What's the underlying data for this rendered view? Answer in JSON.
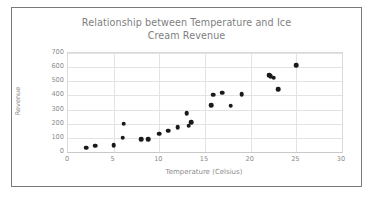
{
  "chart_data": {
    "type": "scatter",
    "title": "Relationship between Temperature and Ice Cream Revenue",
    "title_line1": "Relationship between Temperature and Ice",
    "title_line2": "Cream Revenue",
    "xlabel": "Temperature (Celsius)",
    "ylabel": "Revenue",
    "xlim": [
      0,
      30
    ],
    "ylim": [
      0,
      700
    ],
    "xticks": [
      0,
      5,
      10,
      15,
      20,
      25,
      30
    ],
    "yticks": [
      0,
      100,
      200,
      300,
      400,
      500,
      600,
      700
    ],
    "grid": "horizontal-and-vertical",
    "legend": "none",
    "marker_color": "#1a1a1a",
    "text_color": "#8c8c8c",
    "border_color": "#7a7a7a",
    "gridline_color": "#e3e3e3",
    "points": [
      {
        "x": 2.0,
        "y": 30
      },
      {
        "x": 3.0,
        "y": 45
      },
      {
        "x": 5.0,
        "y": 50
      },
      {
        "x": 6.0,
        "y": 100
      },
      {
        "x": 6.1,
        "y": 200
      },
      {
        "x": 8.0,
        "y": 90
      },
      {
        "x": 8.8,
        "y": 92
      },
      {
        "x": 10.0,
        "y": 130
      },
      {
        "x": 11.0,
        "y": 150
      },
      {
        "x": 12.0,
        "y": 175
      },
      {
        "x": 13.0,
        "y": 275
      },
      {
        "x": 13.2,
        "y": 185
      },
      {
        "x": 13.5,
        "y": 210
      },
      {
        "x": 15.7,
        "y": 330
      },
      {
        "x": 15.9,
        "y": 405
      },
      {
        "x": 16.9,
        "y": 420
      },
      {
        "x": 17.8,
        "y": 328
      },
      {
        "x": 19.0,
        "y": 410
      },
      {
        "x": 22.0,
        "y": 545
      },
      {
        "x": 22.2,
        "y": 535
      },
      {
        "x": 22.5,
        "y": 525
      },
      {
        "x": 23.0,
        "y": 445
      },
      {
        "x": 25.0,
        "y": 615
      }
    ]
  }
}
